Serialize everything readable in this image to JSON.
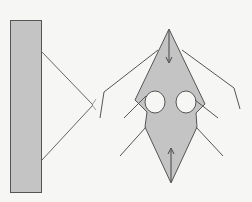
{
  "diagram": {
    "background": "#f6f6f4",
    "fill_color": "#c4c4c4",
    "stroke_color": "#555555",
    "components": [
      "rectangle-panel",
      "triangle",
      "kite-shape-with-two-holes",
      "arrows",
      "guide-lines"
    ]
  }
}
